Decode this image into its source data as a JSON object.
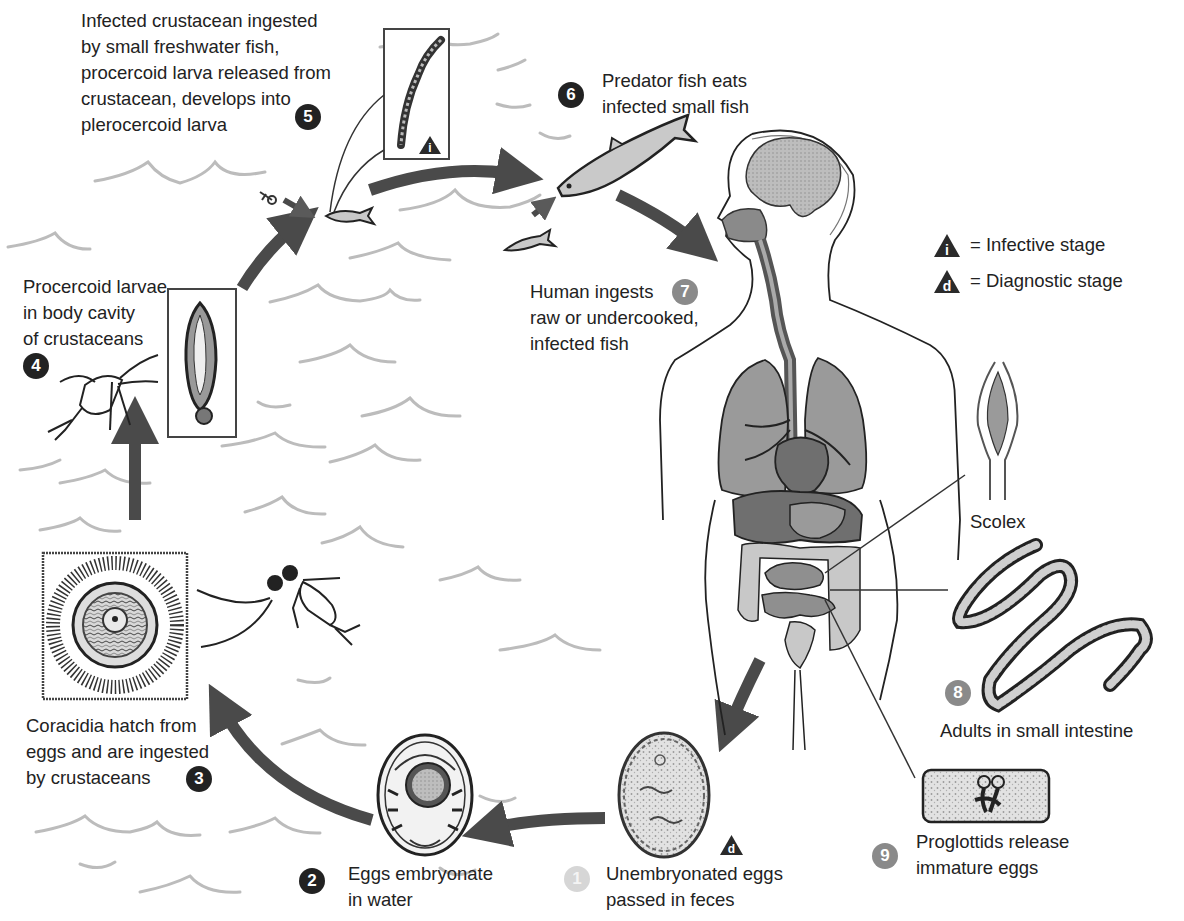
{
  "diagram": {
    "type": "parasite life cycle",
    "colors": {
      "arrow": "#4a4a4a",
      "waves": "#b8b8b8",
      "badge_dark": "#222222",
      "badge_gray": "#8a8a8a",
      "badge_light": "#d6d6d6",
      "organ_dark": "#6f6f6f",
      "organ_mid": "#9a9a9a",
      "organ_light": "#c8c8c8"
    },
    "legend": {
      "infective": {
        "symbol": "i",
        "text": "= Infective stage"
      },
      "diagnostic": {
        "symbol": "d",
        "text": "= Diagnostic stage"
      }
    },
    "stages": [
      {
        "number": "1",
        "text": "Unembryonated eggs\npassed in feces",
        "badge_style": "light",
        "marker": "d"
      },
      {
        "number": "2",
        "text": "Eggs embryonate\nin water",
        "badge_style": "dark"
      },
      {
        "number": "3",
        "text": "Coracidia hatch from\neggs and are ingested\nby crustaceans",
        "badge_style": "dark"
      },
      {
        "number": "4",
        "text": "Procercoid larvae\nin body cavity\nof crustaceans",
        "badge_style": "dark"
      },
      {
        "number": "5",
        "text": "Infected crustacean ingested\nby small freshwater fish,\nprocercoid larva released from\ncrustacean, develops into\nplerocercoid larva",
        "badge_style": "dark",
        "marker": "i"
      },
      {
        "number": "6",
        "text": "Predator fish eats\ninfected small fish",
        "badge_style": "dark"
      },
      {
        "number": "7",
        "text": "Human ingests\nraw or undercooked,\ninfected fish",
        "badge_style": "gray"
      },
      {
        "number": "8",
        "text": "Adults in small intestine",
        "badge_style": "gray"
      },
      {
        "number": "9",
        "text": "Proglottids release\nimmature eggs",
        "badge_style": "gray"
      }
    ],
    "callouts": {
      "scolex": "Scolex"
    },
    "markers": {
      "infective_symbol": "i",
      "diagnostic_symbol": "d"
    }
  }
}
